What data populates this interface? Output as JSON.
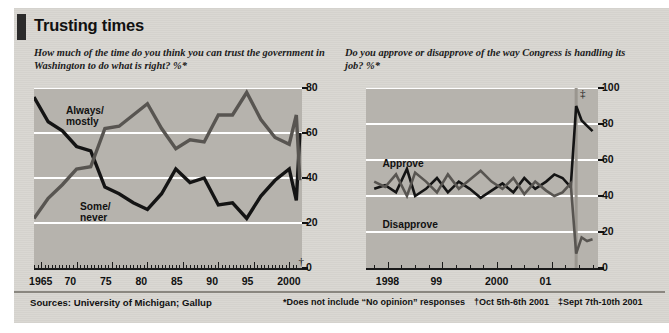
{
  "title": "Trusting times",
  "footer": {
    "sources": "Sources: University of Michigan; Gallup",
    "note_star": "*Does not include “No opinion” responses",
    "note_dagger": "†Oct 5th-6th 2001",
    "note_doubledagger": "‡Sept 7th-10th 2001"
  },
  "colors": {
    "panel_bg": "#b6b3ad",
    "page_bg": "#d9d7d2",
    "grid": "#ffffff",
    "series_dark": "#141414",
    "series_mid": "#585551",
    "text": "#111111"
  },
  "chart_data": [
    {
      "type": "line",
      "panel": "left",
      "title": "How much of the time do you think you can trust the government in Washington to do what is right?  %*",
      "xlabel": "",
      "ylabel": "",
      "xlim": [
        1964,
        2001.8
      ],
      "ylim": [
        0,
        80
      ],
      "yticks": [
        0,
        20,
        40,
        60,
        80
      ],
      "xticks": [
        1965,
        1970,
        1975,
        1980,
        1985,
        1990,
        1995,
        2000
      ],
      "xticklabels": [
        "1965",
        "70",
        "75",
        "80",
        "85",
        "90",
        "95",
        "2000"
      ],
      "grid": true,
      "legend": "inline-annotations",
      "annotations": [
        {
          "text": "Always/\nmostly",
          "x": 1968.5,
          "y": 70
        },
        {
          "text": "Some/\nnever",
          "x": 1970.5,
          "y": 27
        },
        {
          "text": "†",
          "x": 2001.3,
          "y": 3
        }
      ],
      "series": [
        {
          "name": "Always/mostly",
          "color": "#141414",
          "x": [
            1964,
            1966,
            1968,
            1970,
            1972,
            1974,
            1976,
            1978,
            1980,
            1982,
            1984,
            1986,
            1988,
            1990,
            1992,
            1994,
            1996,
            1998,
            2000,
            2001,
            2001.5
          ],
          "values": [
            76,
            65,
            61,
            54,
            52,
            36,
            33,
            29,
            26,
            33,
            44,
            38,
            40,
            28,
            29,
            22,
            32,
            39,
            44,
            30,
            60
          ]
        },
        {
          "name": "Some/never",
          "color": "#585551",
          "x": [
            1964,
            1966,
            1968,
            1970,
            1972,
            1974,
            1976,
            1978,
            1980,
            1982,
            1984,
            1986,
            1988,
            1990,
            1992,
            1994,
            1996,
            1998,
            2000,
            2001,
            2001.5
          ],
          "values": [
            22,
            31,
            37,
            44,
            45,
            62,
            63,
            68,
            73,
            62,
            53,
            57,
            56,
            68,
            68,
            78,
            66,
            58,
            55,
            68,
            39
          ]
        }
      ]
    },
    {
      "type": "line",
      "panel": "right",
      "title": "Do you approve or disapprove of the way Congress is handling its job?  %*",
      "xlabel": "",
      "ylabel": "",
      "xlim": [
        1997.6,
        2001.85
      ],
      "ylim": [
        0,
        100
      ],
      "yticks": [
        0,
        20,
        40,
        60,
        80,
        100
      ],
      "xticks": [
        1998,
        1999,
        2000,
        2001
      ],
      "xticklabels": [
        "1998",
        "99",
        "2000",
        "01"
      ],
      "grid": true,
      "legend": "inline-annotations",
      "annotations": [
        {
          "text": "Approve",
          "x": 1997.9,
          "y": 58
        },
        {
          "text": "Disapprove",
          "x": 1997.9,
          "y": 24
        },
        {
          "text": "‡",
          "x": 2001.52,
          "y": 97
        }
      ],
      "series": [
        {
          "name": "Approve",
          "color": "#141414",
          "x": [
            1997.75,
            1997.95,
            1998.15,
            1998.35,
            1998.5,
            1998.7,
            1998.9,
            1999.1,
            1999.3,
            1999.5,
            1999.7,
            1999.9,
            2000.1,
            2000.3,
            2000.5,
            2000.7,
            2000.9,
            2001.05,
            2001.2,
            2001.35,
            2001.45,
            2001.55,
            2001.65,
            2001.75
          ],
          "values": [
            44,
            46,
            42,
            55,
            40,
            44,
            50,
            42,
            48,
            44,
            39,
            43,
            47,
            42,
            50,
            44,
            48,
            52,
            50,
            45,
            90,
            82,
            79,
            76
          ]
        },
        {
          "name": "Disapprove",
          "color": "#585551",
          "x": [
            1997.75,
            1997.95,
            1998.15,
            1998.35,
            1998.5,
            1998.7,
            1998.9,
            1999.1,
            1999.3,
            1999.5,
            1999.7,
            1999.9,
            2000.1,
            2000.3,
            2000.5,
            2000.7,
            2000.9,
            2001.05,
            2001.2,
            2001.35,
            2001.45,
            2001.55,
            2001.65,
            2001.75
          ],
          "values": [
            48,
            45,
            52,
            40,
            53,
            48,
            42,
            52,
            44,
            49,
            54,
            48,
            44,
            50,
            41,
            48,
            43,
            40,
            42,
            47,
            8,
            17,
            15,
            16
          ]
        }
      ]
    }
  ]
}
